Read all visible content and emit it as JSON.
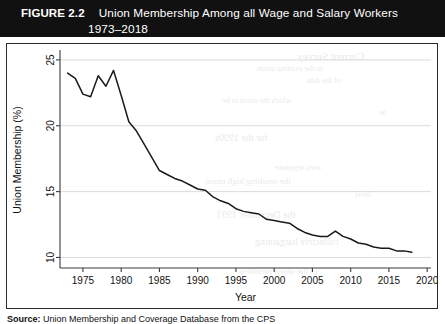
{
  "figure": {
    "label": "FIGURE 2.2",
    "title": "Union Membership Among all Wage and Salary Workers",
    "years": "1973–2018"
  },
  "source": {
    "label": "Source:",
    "text": "Union Membership and Coverage Database from the CPS"
  },
  "chart_data": {
    "type": "line",
    "title": "Union Membership Among all Wage and Salary Workers 1973–2018",
    "xlabel": "Year",
    "ylabel": "Union Membership (%)",
    "xlim": [
      1972,
      2020.5
    ],
    "ylim": [
      9.2,
      25.6
    ],
    "xticks": [
      1975,
      1980,
      1985,
      1990,
      1995,
      2000,
      2005,
      2010,
      2015,
      2020
    ],
    "yticks": [
      10,
      15,
      20,
      25
    ],
    "grid": true,
    "legend": false,
    "series_name": "Union membership rate",
    "x": [
      1973,
      1974,
      1975,
      1976,
      1977,
      1978,
      1979,
      1980,
      1981,
      1982,
      1983,
      1984,
      1985,
      1986,
      1987,
      1988,
      1989,
      1990,
      1991,
      1992,
      1993,
      1994,
      1995,
      1996,
      1997,
      1998,
      1999,
      2000,
      2001,
      2002,
      2003,
      2004,
      2005,
      2006,
      2007,
      2008,
      2009,
      2010,
      2011,
      2012,
      2013,
      2014,
      2015,
      2016,
      2017,
      2018
    ],
    "y": [
      24.0,
      23.6,
      22.4,
      22.2,
      23.8,
      23.0,
      24.2,
      22.3,
      20.3,
      19.6,
      18.6,
      17.6,
      16.6,
      16.3,
      16.0,
      15.8,
      15.5,
      15.2,
      15.1,
      14.6,
      14.3,
      14.1,
      13.7,
      13.5,
      13.4,
      13.3,
      12.9,
      12.8,
      12.7,
      12.6,
      12.2,
      11.9,
      11.7,
      11.6,
      11.6,
      12.0,
      11.6,
      11.4,
      11.1,
      11.0,
      10.8,
      10.7,
      10.7,
      10.5,
      10.5,
      10.4
    ]
  },
  "ghost_text": [
    {
      "t": "Current Survey",
      "x": 290,
      "y": 6,
      "s": 11
    },
    {
      "t": "to the existing union",
      "x": 250,
      "y": 20,
      "s": 8
    },
    {
      "t": "of the data",
      "x": 300,
      "y": 32,
      "s": 8
    },
    {
      "t": "which the union to be",
      "x": 215,
      "y": 52,
      "s": 8
    },
    {
      "t": "he",
      "x": 372,
      "y": 64,
      "s": 8
    },
    {
      "t": "for the 1990s",
      "x": 208,
      "y": 88,
      "s": 10
    },
    {
      "t": "aws  separate",
      "x": 268,
      "y": 118,
      "s": 9
    },
    {
      "t": "the resulting high union",
      "x": 198,
      "y": 132,
      "s": 9
    },
    {
      "t": "level",
      "x": 348,
      "y": 146,
      "s": 8
    },
    {
      "t": "the December 1993",
      "x": 210,
      "y": 165,
      "s": 10
    },
    {
      "t": "collective bargaining",
      "x": 248,
      "y": 192,
      "s": 10
    },
    {
      "t": "of the union members",
      "x": 232,
      "y": 222,
      "s": 9
    }
  ]
}
